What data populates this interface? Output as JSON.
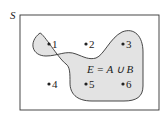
{
  "diagram": {
    "universe_label": "S",
    "region_label": "E = A ∪ B",
    "region_fill": "#e3e3e3",
    "stroke_color": "#333333",
    "points": [
      {
        "label": "1",
        "x": 49,
        "y": 44,
        "in_region": true
      },
      {
        "label": "2",
        "x": 86,
        "y": 44,
        "in_region": true
      },
      {
        "label": "3",
        "x": 123,
        "y": 44,
        "in_region": true
      },
      {
        "label": "4",
        "x": 49,
        "y": 84,
        "in_region": false
      },
      {
        "label": "5",
        "x": 86,
        "y": 84,
        "in_region": true
      },
      {
        "label": "6",
        "x": 123,
        "y": 84,
        "in_region": true
      }
    ]
  }
}
